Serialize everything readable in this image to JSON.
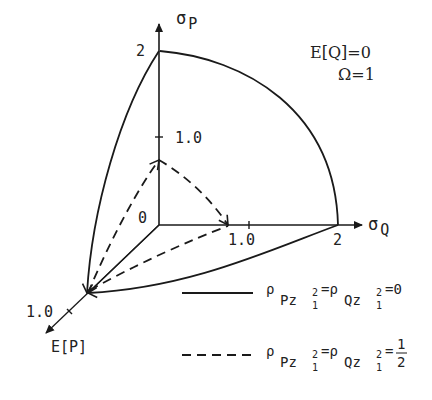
{
  "figure": {
    "colors": {
      "ink": "#1a1a1a",
      "background": "#ffffff"
    },
    "axes": {
      "sigma_p": {
        "label_main": "σ",
        "label_sub": "P",
        "tick_top": "2",
        "tick_mid": "1.0"
      },
      "sigma_q": {
        "label_main": "σ",
        "label_sub": "Q",
        "tick_mid": "1.0",
        "tick_end": "2"
      },
      "e_p": {
        "label": "E[P]",
        "tick": "1.0"
      },
      "origin": "0"
    },
    "parameters": {
      "line1": "E[Q]=0",
      "line2": "Ω=1"
    },
    "legend": [
      {
        "style": "solid",
        "rho": "ρ",
        "sub1": "Pz",
        "sup": "2",
        "subsub": "1",
        "eq": "=",
        "sub2": "Qz",
        "value": "=0"
      },
      {
        "style": "dashed",
        "rho": "ρ",
        "sub1": "Pz",
        "sup": "2",
        "subsub": "1",
        "eq": "=",
        "sub2": "Qz",
        "value_prefix": "=",
        "frac_num": "1",
        "frac_den": "2"
      }
    ]
  }
}
